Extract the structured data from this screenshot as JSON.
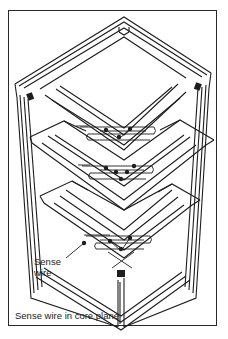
{
  "diagram": {
    "labels": {
      "sense_wire_line1": "Sense",
      "sense_wire_line2": "wire"
    },
    "caption": "Sense wire in core plane",
    "colors": {
      "line": "#1e1e1e",
      "background": "#ffffff",
      "frame": "#2a2a2a"
    },
    "planes": [
      {
        "name": "top-plane"
      },
      {
        "name": "middle-plane"
      },
      {
        "name": "bottom-plane"
      }
    ]
  }
}
